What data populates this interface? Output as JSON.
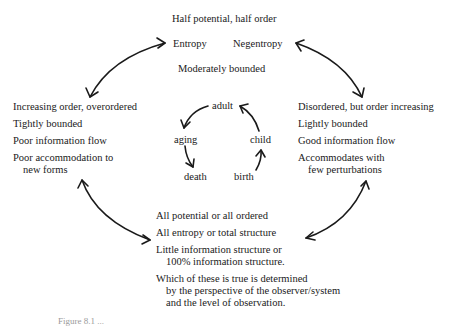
{
  "top": {
    "title": "Half potential, half order",
    "left_label": "Entropy",
    "right_label": "Negentropy",
    "subtitle": "Moderately bounded"
  },
  "left": {
    "lines": [
      "Increasing order, overordered",
      "Tightly bounded",
      "Poor information flow",
      "Poor accommodation to",
      "new forms"
    ]
  },
  "right": {
    "lines": [
      "Disordered, but order increasing",
      "Lightly bounded",
      "Good information flow",
      "Accommodates with",
      "few perturbations"
    ]
  },
  "bottom": {
    "lines": [
      "All potential or all ordered",
      "All entropy or total structure",
      "Little information structure or",
      "100% information structure.",
      "Which of these is true is determined",
      "by the perspective of the observer/system",
      "and the level of observation."
    ]
  },
  "life_cycle": {
    "adult": "adult",
    "aging": "aging",
    "death": "death",
    "birth": "birth",
    "child": "child"
  },
  "caption": "Figure 8.1 ..."
}
